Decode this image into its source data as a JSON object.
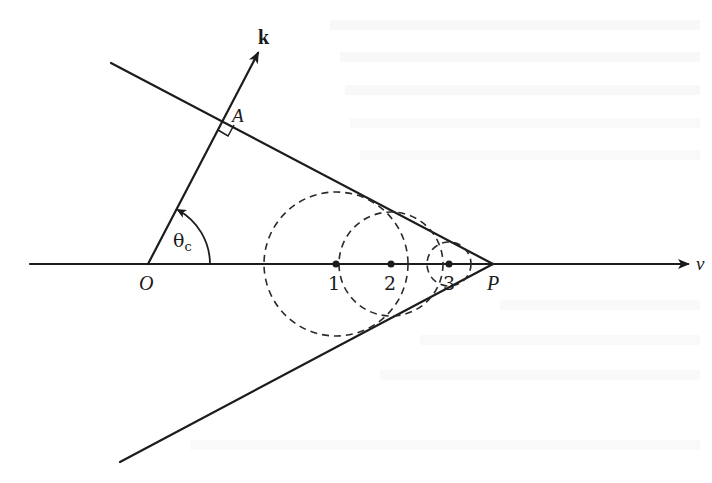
{
  "figure": {
    "labels": {
      "k": "k",
      "A": "A",
      "theta": "θ",
      "theta_sub": "c",
      "O": "O",
      "P": "P",
      "v": "v",
      "point1": "1",
      "point2": "2",
      "point3": "3"
    },
    "colors": {
      "ink": "#1c1c1c",
      "background": "#ffffff",
      "bleed_through_text": "#ececec"
    },
    "geometry": {
      "axis": {
        "x_start": 30,
        "x_end": 690,
        "y": 264
      },
      "origin_O": [
        148,
        264
      ],
      "apex_P": [
        493,
        264
      ],
      "point_A": [
        222,
        123
      ],
      "k_tip": [
        260,
        50
      ],
      "upper_line_start": [
        111,
        63
      ],
      "lower_line_start": [
        120,
        462
      ],
      "wavefronts": [
        {
          "label": "1",
          "cx": 336,
          "cy": 264,
          "r": 72
        },
        {
          "label": "2",
          "cx": 391,
          "cy": 264,
          "r": 52
        },
        {
          "label": "3",
          "cx": 449,
          "cy": 264,
          "r": 22
        }
      ]
    }
  }
}
